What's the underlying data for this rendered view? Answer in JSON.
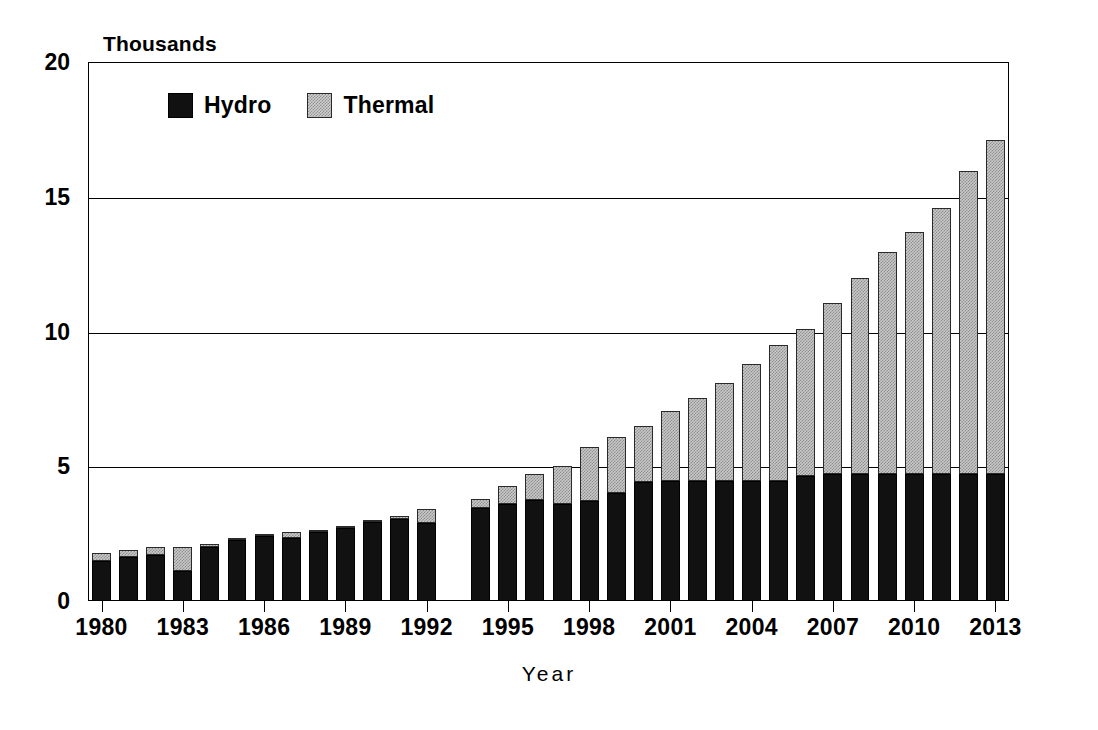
{
  "chart_data": {
    "type": "bar",
    "subtype": "stacked-vertical",
    "title": "",
    "unit_caption": "Thousands",
    "xlabel": "Year",
    "ylabel": "",
    "ylim": [
      0,
      20
    ],
    "yticks": [
      0,
      5,
      10,
      15,
      20
    ],
    "ytick_labels": [
      "0",
      "5",
      "10",
      "15",
      "20"
    ],
    "grid": "horizontal",
    "legend_position": "top-left-inside",
    "categories": [
      "1980",
      "1981",
      "1982",
      "1983",
      "1984",
      "1985",
      "1986",
      "1987",
      "1988",
      "1989",
      "1990",
      "1991",
      "1992",
      "1993",
      "1994",
      "1995",
      "1996",
      "1997",
      "1998",
      "1999",
      "2000",
      "2001",
      "2002",
      "2003",
      "2004",
      "2005",
      "2006",
      "2007",
      "2008",
      "2009",
      "2010",
      "2011",
      "2012",
      "2013"
    ],
    "xtick_labels": [
      "1980",
      "1983",
      "1986",
      "1989",
      "1992",
      "1995",
      "1998",
      "2001",
      "2004",
      "2007",
      "2010",
      "2013"
    ],
    "series": [
      {
        "name": "Hydro",
        "color": "#111111",
        "pattern": "solid",
        "values": [
          1.5,
          1.65,
          1.7,
          1.1,
          2.0,
          2.25,
          2.4,
          2.35,
          2.55,
          2.7,
          2.95,
          3.05,
          2.9,
          null,
          3.45,
          3.6,
          3.75,
          3.6,
          3.7,
          4.0,
          4.4,
          4.45,
          4.45,
          4.45,
          4.45,
          4.45,
          4.65,
          4.7,
          4.7,
          4.7,
          4.7,
          4.7,
          4.7,
          4.7
        ]
      },
      {
        "name": "Thermal",
        "color": "#c9c9c9",
        "pattern": "checker-dither",
        "values": [
          0.3,
          0.25,
          0.3,
          0.9,
          0.1,
          0.05,
          0.05,
          0.2,
          0.1,
          0.1,
          0.05,
          0.1,
          0.5,
          null,
          0.35,
          0.65,
          0.95,
          1.4,
          2.0,
          2.1,
          2.1,
          2.6,
          3.1,
          3.65,
          4.35,
          5.05,
          5.45,
          6.35,
          7.3,
          8.25,
          9.0,
          9.9,
          11.25,
          12.4
        ]
      }
    ],
    "totals": [
      1.8,
      1.9,
      2.0,
      2.0,
      2.1,
      2.3,
      2.45,
      2.55,
      2.65,
      2.8,
      3.0,
      3.15,
      3.4,
      null,
      3.8,
      4.25,
      4.7,
      5.0,
      5.7,
      6.1,
      6.5,
      7.05,
      7.55,
      8.1,
      8.8,
      9.5,
      10.1,
      11.05,
      12.0,
      12.95,
      13.7,
      14.6,
      15.95,
      17.1
    ]
  },
  "legend": {
    "items": [
      {
        "label": "Hydro"
      },
      {
        "label": "Thermal"
      }
    ]
  }
}
